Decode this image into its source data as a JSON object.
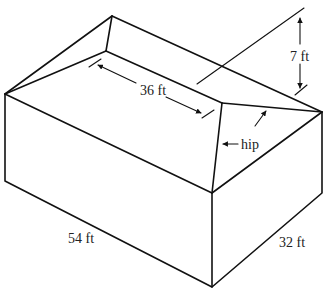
{
  "diagram": {
    "labels": {
      "ridge_length": "36 ft",
      "roof_height": "7 ft",
      "hip": "hip",
      "length": "54 ft",
      "width": "32 ft"
    },
    "colors": {
      "line": "#111111",
      "background": "#ffffff"
    }
  }
}
